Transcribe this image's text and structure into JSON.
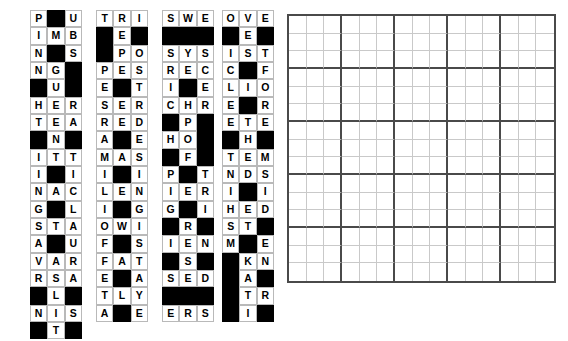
{
  "app": {
    "title": "Crossword Piece Assembly Puzzle",
    "description": "Left: tray of 3x3 crossword fragments. Right: empty 15x15 assembly board."
  },
  "colors": {
    "cell_fill": "#ffffff",
    "cell_border": "#b9b9b9",
    "blocked_fill": "#000000",
    "letter": "#000000",
    "board_thick_line": "#4a4a4a",
    "board_thin_line": "#c9c9c9",
    "background": "#ffffff"
  },
  "tray": {
    "name": "piece-tray",
    "columns": 4,
    "rows": 7,
    "piece_size": 3,
    "piece_count": 25,
    "blocked_marker": "#",
    "pieces": [
      {
        "id": "piece-1",
        "row": 1,
        "col": 1,
        "grid": [
          [
            "P",
            "#",
            "U"
          ],
          [
            "I",
            "M",
            "B"
          ],
          [
            "N",
            "#",
            "S"
          ]
        ]
      },
      {
        "id": "piece-2",
        "row": 1,
        "col": 2,
        "grid": [
          [
            "T",
            "R",
            "I"
          ],
          [
            "#",
            "E",
            "#"
          ],
          [
            "#",
            "P",
            "O"
          ]
        ]
      },
      {
        "id": "piece-3",
        "row": 1,
        "col": 3,
        "grid": [
          [
            "S",
            "W",
            "E"
          ],
          [
            "#",
            "#",
            "#"
          ],
          [
            "S",
            "Y",
            "S"
          ]
        ]
      },
      {
        "id": "piece-4",
        "row": 1,
        "col": 4,
        "grid": [
          [
            "O",
            "V",
            "E"
          ],
          [
            "#",
            "E",
            "#"
          ],
          [
            "I",
            "S",
            "T"
          ]
        ]
      },
      {
        "id": "piece-5",
        "row": 2,
        "col": 1,
        "grid": [
          [
            "N",
            "G",
            "#"
          ],
          [
            "#",
            "U",
            "#"
          ],
          [
            "H",
            "E",
            "R"
          ]
        ]
      },
      {
        "id": "piece-6",
        "row": 2,
        "col": 2,
        "grid": [
          [
            "P",
            "E",
            "S"
          ],
          [
            "E",
            "#",
            "T"
          ],
          [
            "S",
            "E",
            "R"
          ]
        ]
      },
      {
        "id": "piece-7",
        "row": 2,
        "col": 3,
        "grid": [
          [
            "R",
            "E",
            "C"
          ],
          [
            "I",
            "#",
            "E"
          ],
          [
            "C",
            "H",
            "R"
          ]
        ]
      },
      {
        "id": "piece-8",
        "row": 2,
        "col": 4,
        "grid": [
          [
            "C",
            "#",
            "F"
          ],
          [
            "L",
            "I",
            "O"
          ],
          [
            "E",
            "#",
            "R"
          ]
        ]
      },
      {
        "id": "piece-9",
        "row": 3,
        "col": 1,
        "grid": [
          [
            "T",
            "E",
            "A"
          ],
          [
            "#",
            "N",
            "#"
          ],
          [
            "I",
            "T",
            "T"
          ]
        ]
      },
      {
        "id": "piece-10",
        "row": 3,
        "col": 2,
        "grid": [
          [
            "R",
            "E",
            "D"
          ],
          [
            "A",
            "#",
            "E"
          ],
          [
            "M",
            "A",
            "S"
          ]
        ]
      },
      {
        "id": "piece-11",
        "row": 3,
        "col": 3,
        "grid": [
          [
            "#",
            "P",
            "#"
          ],
          [
            "H",
            "O",
            "#"
          ],
          [
            "#",
            "F",
            "#"
          ]
        ]
      },
      {
        "id": "piece-12",
        "row": 3,
        "col": 4,
        "grid": [
          [
            "E",
            "T",
            "E"
          ],
          [
            "#",
            "H",
            "#"
          ],
          [
            "T",
            "E",
            "M"
          ]
        ]
      },
      {
        "id": "piece-13",
        "row": 4,
        "col": 1,
        "grid": [
          [
            "I",
            "#",
            "I"
          ],
          [
            "N",
            "A",
            "C"
          ],
          [
            "G",
            "#",
            "L"
          ]
        ]
      },
      {
        "id": "piece-14",
        "row": 4,
        "col": 2,
        "grid": [
          [
            "I",
            "#",
            "I"
          ],
          [
            "L",
            "E",
            "N"
          ],
          [
            "I",
            "#",
            "G"
          ]
        ]
      },
      {
        "id": "piece-15",
        "row": 4,
        "col": 3,
        "grid": [
          [
            "P",
            "#",
            "T"
          ],
          [
            "I",
            "E",
            "R"
          ],
          [
            "G",
            "#",
            "I"
          ]
        ]
      },
      {
        "id": "piece-16",
        "row": 4,
        "col": 4,
        "grid": [
          [
            "N",
            "D",
            "S"
          ],
          [
            "I",
            "#",
            "I"
          ],
          [
            "H",
            "E",
            "D"
          ]
        ]
      },
      {
        "id": "piece-17",
        "row": 5,
        "col": 1,
        "grid": [
          [
            "S",
            "T",
            "A"
          ],
          [
            "A",
            "#",
            "U"
          ],
          [
            "V",
            "A",
            "R"
          ]
        ]
      },
      {
        "id": "piece-18",
        "row": 5,
        "col": 2,
        "grid": [
          [
            "O",
            "W",
            "I"
          ],
          [
            "F",
            "#",
            "S"
          ],
          [
            "F",
            "A",
            "T"
          ]
        ]
      },
      {
        "id": "piece-19",
        "row": 5,
        "col": 3,
        "grid": [
          [
            "#",
            "R",
            "#"
          ],
          [
            "I",
            "E",
            "N"
          ],
          [
            "#",
            "S",
            "#"
          ]
        ]
      },
      {
        "id": "piece-20",
        "row": 5,
        "col": 4,
        "grid": [
          [
            "S",
            "T",
            "#"
          ],
          [
            "M",
            "#",
            "E"
          ],
          [
            "#",
            "K",
            "N"
          ]
        ]
      },
      {
        "id": "piece-21",
        "row": 6,
        "col": 1,
        "grid": [
          [
            "R",
            "S",
            "A"
          ],
          [
            "#",
            "L",
            "#"
          ],
          [
            "N",
            "I",
            "S"
          ]
        ]
      },
      {
        "id": "piece-22",
        "row": 6,
        "col": 2,
        "grid": [
          [
            "E",
            "#",
            "A"
          ],
          [
            "T",
            "L",
            "Y"
          ],
          [
            "A",
            "#",
            "E"
          ]
        ]
      },
      {
        "id": "piece-23",
        "row": 6,
        "col": 3,
        "grid": [
          [
            "S",
            "E",
            "D"
          ],
          [
            "#",
            "#",
            "#"
          ],
          [
            "E",
            "R",
            "S"
          ]
        ]
      },
      {
        "id": "piece-24",
        "row": 6,
        "col": 4,
        "grid": [
          [
            "#",
            "A",
            "#"
          ],
          [
            "#",
            "T",
            "R"
          ],
          [
            "#",
            "I",
            "#"
          ]
        ]
      },
      {
        "id": "piece-25",
        "row": 7,
        "col": 1,
        "grid": [
          [
            "#",
            "T",
            "#"
          ]
        ]
      }
    ]
  },
  "board": {
    "name": "assembly-board",
    "columns": 15,
    "rows": 15,
    "block_size": 3,
    "cells_filled": 0,
    "empty": true
  }
}
